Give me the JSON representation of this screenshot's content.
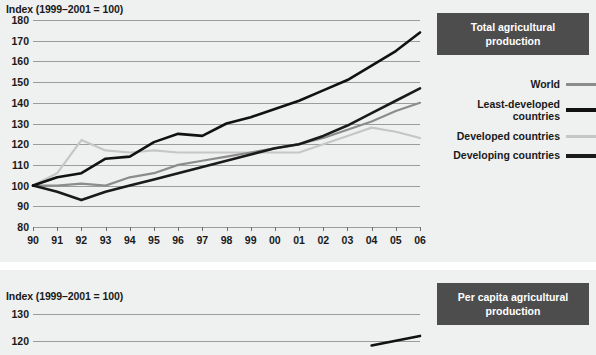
{
  "charts": [
    {
      "panel_id": "top",
      "title": "Total agricultural production",
      "axis_title": "Index (1999–2001 = 100)",
      "ylabels": [
        "180",
        "170",
        "160",
        "150",
        "140",
        "130",
        "120",
        "110",
        "100",
        "90",
        "80"
      ],
      "xlabels": [
        "90",
        "91",
        "92",
        "93",
        "94",
        "95",
        "96",
        "97",
        "98",
        "99",
        "00",
        "01",
        "02",
        "03",
        "04",
        "05",
        "06"
      ]
    },
    {
      "panel_id": "bottom",
      "title": "Per capita agricultural production",
      "axis_title": "Index (1999–2001 = 100)",
      "ylabels": [
        "130",
        "120"
      ],
      "xlabels": []
    }
  ],
  "legend": {
    "items": [
      {
        "label": "World",
        "color": "#8c8c8c",
        "width": 3
      },
      {
        "label": "Least-developed countries",
        "color": "#111111",
        "width": 4
      },
      {
        "label": "Developed countries",
        "color": "#c6c6c6",
        "width": 3
      },
      {
        "label": "Developing countries",
        "color": "#1a1a1a",
        "width": 4
      }
    ]
  },
  "chart_data": [
    {
      "type": "line",
      "title": "Total agricultural production",
      "xlabel": "",
      "ylabel": "Index (1999–2001 = 100)",
      "xlim": [
        1990,
        2006
      ],
      "ylim": [
        80,
        180
      ],
      "grid": true,
      "legend_position": "right",
      "x": [
        1990,
        1991,
        1992,
        1993,
        1994,
        1995,
        1996,
        1997,
        1998,
        1999,
        2000,
        2001,
        2002,
        2003,
        2004,
        2005,
        2006
      ],
      "categories": [
        "90",
        "91",
        "92",
        "93",
        "94",
        "95",
        "96",
        "97",
        "98",
        "99",
        "00",
        "01",
        "02",
        "03",
        "04",
        "05",
        "06"
      ],
      "series": [
        {
          "name": "Least-developed countries",
          "color": "#111111",
          "values": [
            100,
            104,
            106,
            113,
            114,
            121,
            125,
            124,
            130,
            133,
            137,
            141,
            146,
            151,
            158,
            165,
            174
          ]
        },
        {
          "name": "Developing countries",
          "color": "#1a1a1a",
          "values": [
            100,
            97,
            93,
            97,
            100,
            103,
            106,
            109,
            112,
            115,
            118,
            120,
            124,
            129,
            135,
            141,
            147
          ]
        },
        {
          "name": "World",
          "color": "#8c8c8c",
          "values": [
            100,
            100,
            101,
            100,
            104,
            106,
            110,
            112,
            114,
            116,
            118,
            120,
            123,
            127,
            131,
            136,
            140
          ]
        },
        {
          "name": "Developed countries",
          "color": "#c6c6c6",
          "values": [
            100,
            106,
            122,
            117,
            116,
            117,
            116,
            116,
            116,
            116,
            116,
            116,
            120,
            124,
            128,
            126,
            123
          ]
        }
      ]
    },
    {
      "type": "line",
      "title": "Per capita agricultural production",
      "xlabel": "",
      "ylabel": "Index (1999–2001 = 100)",
      "ylim": [
        115,
        133
      ],
      "grid": true,
      "legend_position": "right",
      "note": "Panel cropped by screenshot edge; only the 130 and 120 gridlines and the rising tail of one dark series are visible.",
      "x": [
        1990,
        1991,
        1992,
        1993,
        1994,
        1995,
        1996,
        1997,
        1998,
        1999,
        2000,
        2001,
        2002,
        2003,
        2004,
        2005,
        2006
      ],
      "series": [
        {
          "name": "Least-developed countries",
          "color": "#111111",
          "values": [
            null,
            null,
            null,
            null,
            null,
            null,
            null,
            null,
            null,
            null,
            null,
            null,
            null,
            null,
            118.5,
            120.2,
            122.0
          ]
        }
      ]
    }
  ]
}
